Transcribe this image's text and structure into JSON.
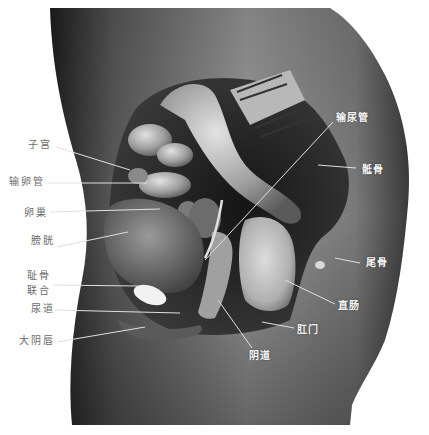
{
  "figure": {
    "colors": {
      "background": "#ffffff",
      "body_light": "#bdbdbd",
      "body_dark": "#2a2a2a",
      "organ_light": "#d6d6d6",
      "label_left": "#6a6a6a",
      "label_right": "#f4f4f4",
      "leader_line": "#e8e8e8"
    }
  },
  "labels": {
    "left": [
      {
        "text": "子宫",
        "x": 28,
        "y": 139
      },
      {
        "text": "输卵管",
        "x": 9,
        "y": 176
      },
      {
        "text": "卵巢",
        "x": 24,
        "y": 207
      },
      {
        "text": "膀胱",
        "x": 31,
        "y": 235
      },
      {
        "text": "耻骨",
        "x": 27,
        "y": 270
      },
      {
        "text": "联合",
        "x": 27,
        "y": 285
      },
      {
        "text": "尿道",
        "x": 31,
        "y": 303
      },
      {
        "text": "大阴唇",
        "x": 19,
        "y": 335
      }
    ],
    "right": [
      {
        "text": "输尿管",
        "x": 336,
        "y": 112
      },
      {
        "text": "骶骨",
        "x": 362,
        "y": 164
      },
      {
        "text": "尾骨",
        "x": 366,
        "y": 257
      },
      {
        "text": "直肠",
        "x": 338,
        "y": 300
      },
      {
        "text": "肛门",
        "x": 297,
        "y": 324
      },
      {
        "text": "阴道",
        "x": 249,
        "y": 350
      }
    ]
  }
}
